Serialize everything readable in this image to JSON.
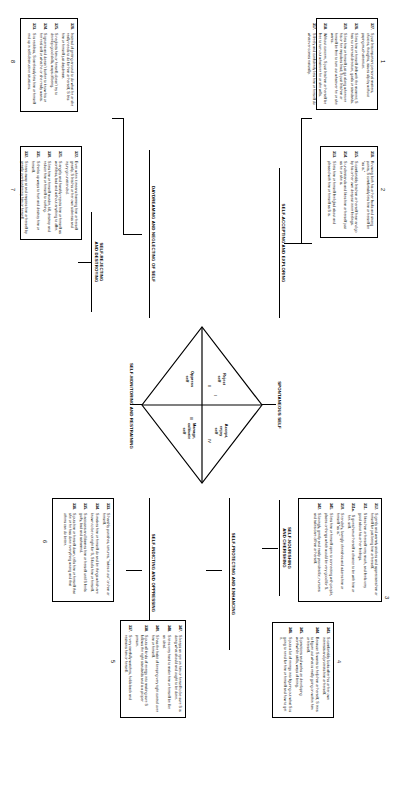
{
  "figure": {
    "orientation": "rotated-90"
  },
  "diamond": {
    "quadrants": [
      {
        "roman": "I",
        "label": "Accept,\nenjoy\nself"
      },
      {
        "roman": "II",
        "label": "Reject\nself"
      },
      {
        "roman": "III",
        "label": "Oppress\nself"
      },
      {
        "roman": "IV",
        "label": "Manage,\ncultivate\nself"
      }
    ],
    "axis_labels": {
      "top": "SPONTANEOUS SELF",
      "bottom": "SELF-MONITORING AND RESTRAINING"
    }
  },
  "headers": {
    "top_left": "SELF-ACCEPTING AND EXPLORING",
    "top_right": "SELF-NOURISHING\nAND CHERISHING",
    "bottom_left": "DAYDREAMING AND NEGLECTING OF SELF",
    "left_lower": "SELF-REJECTING\nAND DESTROYING",
    "right_upper": "SELF-PROTECTING AND ENHANCING",
    "right_lower": "SELF-INDICTING AND OPPRESSING"
  },
  "boxes": [
    {
      "id": "1",
      "number": "1",
      "items": [
        {
          "n": "327.",
          "t": "S just lets important personal matters, choices, thoughts, issues slip by without paying much attention."
        },
        {
          "n": "326.",
          "t": "S lets him or herself drift with the moment; S has no internal direction, goals or standards."
        },
        {
          "n": "319.",
          "t": "S lets him or herself just go along wherever his or her impulses lead; S just lets him or herself be free to turn out whatever he or she wants."
        },
        {
          "n": "318.",
          "t": "Without concern, S just lets him or herself be free to turn out whatever he or she wills."
        },
        {
          "n": "317.",
          "t": "S freely and confidently lets him or herself do whatever comes naturally."
        }
      ]
    },
    {
      "id": "2",
      "number": "2",
      "items": [
        {
          "n": "316.",
          "t": "Knowing both his or her faults and strong points, S comfortably lets him or herself be \"as is.\""
        },
        {
          "n": "315.",
          "t": "S comfortably lets him or herself hear and go by his or her own deepest inner feelings."
        },
        {
          "n": "314.",
          "t": "S understands and likes him or herself just as he or she is."
        },
        {
          "n": "313.",
          "t": "S lets him or herself feel glad about and pleased with him or herself as S is."
        }
      ]
    },
    {
      "id": "3",
      "number": "3",
      "items": [
        {
          "n": "312.",
          "t": "S gently and warmly strokes and appreciates him or herself for just being him or herself."
        },
        {
          "n": "311.",
          "t": "S likes him or herself very much, and feels very good about his or her feelings."
        },
        {
          "n": "311a.",
          "t": "S gives him or herself a chance to be with him or her- self."
        },
        {
          "n": "310.",
          "t": "S tenderly, lovingly cherishes and adores him or herself \"as is.\""
        },
        {
          "n": "341.",
          "t": "S lets him or herself open to connecting with people, places or things which would be very good for S."
        },
        {
          "n": "342.",
          "t": "S lovingly, gently and easily provides for, nurtures and takes care of him or herself."
        }
      ]
    },
    {
      "id": "4",
      "number": "4",
      "items": [
        {
          "n": "343.",
          "t": "S comfortably looks after his or her own interests and protects him or herself."
        },
        {
          "n": "344.",
          "t": "Because S wants to help him or herself, S tries to figure out what is really going on within him or herself."
        },
        {
          "n": "345.",
          "t": "S practices and works on developing worthwhile skills, ways of being."
        },
        {
          "n": "346.",
          "t": "S puts a lot of energy into figuring out what S is going to need for him or herself and how to get it."
        }
      ]
    },
    {
      "id": "5",
      "number": "5",
      "items": [
        {
          "n": "347.",
          "t": "S keeps an eye on him or herself to be sure S is doing what should and ought to be done."
        },
        {
          "n": "348.",
          "t": "S tries very hard to make him or herself be like an ideal."
        },
        {
          "n": "340.",
          "t": "S has the habit of keeping very tight control over him or herself."
        },
        {
          "n": "338.",
          "t": "S puts all kinds of energy into making sure S follows the right standards and is a proper person."
        },
        {
          "n": "337.",
          "t": "S very carefully watches, holds back and restrains him or herself."
        }
      ]
    },
    {
      "id": "6",
      "number": "6",
      "items": [
        {
          "n": "333.",
          "t": "S harshly punishes, tortures, \"takes it out\" on him or herself."
        },
        {
          "n": "334.",
          "t": "S makes him or herself do and be things which are known to be not right for S, S fools him or herself."
        },
        {
          "n": "335.",
          "t": "S accuses and blames him or herself until S feels guilty, bad and ashamed."
        },
        {
          "n": "336.",
          "t": "S puts him or herself down, tells him or herself that she or he has done everything wrong and that others can do better."
        }
      ]
    },
    {
      "id": "7",
      "number": "7",
      "items": [
        {
          "n": "322.",
          "t": "Even when it means harming him or herself greatly, S lets his or her own sickness and injury go unattended."
        },
        {
          "n": "321.",
          "t": "S angrily and harshly rejects him or herself as worthless, bad and without anything to offer."
        },
        {
          "n": "330.",
          "t": "S lets him or herself murder, kill, destroy and reduce him or herself to nothing."
        },
        {
          "n": "331.",
          "t": "S thinks up ways to hurt and destroy him or herself."
        },
        {
          "n": "332.",
          "t": "S tears away at and empties him or herself by greatly overburdening him or herself."
        }
      ]
    },
    {
      "id": "8",
      "number": "8",
      "items": [
        {
          "n": "326.",
          "t": "Instead of getting around to do what he or she really needs to do for him or herself, S lets him or herself just daydream."
        },
        {
          "n": "325.",
          "t": "S neglects him or herself; doesn't try to develop good skills, ways of being."
        },
        {
          "n": "324.",
          "t": "S ignores and doesn't bother to know his or her real self or what he or she really wants."
        },
        {
          "n": "323.",
          "t": "S is reckless, S carelessly lets him or herself end up in self-destructive situations."
        }
      ]
    }
  ]
}
